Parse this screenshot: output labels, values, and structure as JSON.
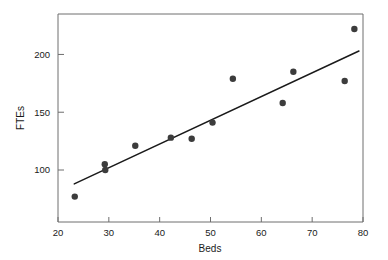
{
  "chart_data": {
    "type": "scatter",
    "title": "",
    "xlabel": "Beds",
    "ylabel": "FTEs",
    "xlim": [
      20,
      80
    ],
    "ylim": [
      55,
      235
    ],
    "xticks": [
      20,
      30,
      40,
      50,
      60,
      70,
      80
    ],
    "xtick_labels": [
      "20",
      "30",
      "40",
      "50",
      "60",
      "70",
      "80"
    ],
    "yticks": [
      100,
      150,
      200
    ],
    "ytick_labels": [
      "100",
      "150",
      "200"
    ],
    "grid": false,
    "legend": null,
    "marker": {
      "shape": "circle",
      "color": "#3c3c3c",
      "size_px": 3.2
    },
    "points": [
      {
        "x": 23.3,
        "y": 77
      },
      {
        "x": 29.2,
        "y": 105
      },
      {
        "x": 29.3,
        "y": 100
      },
      {
        "x": 35.2,
        "y": 121
      },
      {
        "x": 42.2,
        "y": 128
      },
      {
        "x": 46.3,
        "y": 127
      },
      {
        "x": 50.4,
        "y": 141
      },
      {
        "x": 54.4,
        "y": 179
      },
      {
        "x": 64.2,
        "y": 158
      },
      {
        "x": 66.3,
        "y": 185
      },
      {
        "x": 76.4,
        "y": 177
      },
      {
        "x": 78.3,
        "y": 222
      }
    ],
    "fit_line": {
      "label": "least-squares fit",
      "color": "#1a1a1a",
      "x_start": 23.2,
      "y_start": 88,
      "x_end": 79.2,
      "y_end": 203
    }
  },
  "axes": {
    "spine_color": "#6e6e6e",
    "tick_color": "#6e6e6e"
  }
}
